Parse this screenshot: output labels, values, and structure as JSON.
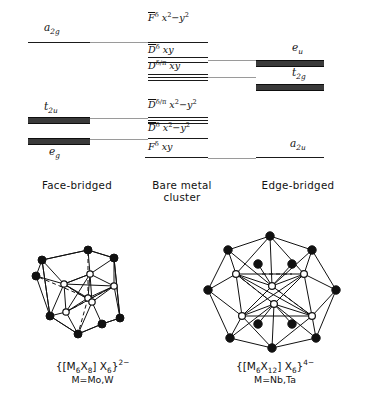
{
  "figure": {
    "type": "molecular-orbital-correlation-diagram",
    "columns": [
      {
        "key": "face_bridged",
        "caption": "Face-bridged",
        "caption_line2": ""
      },
      {
        "key": "bare_metal",
        "caption": "Bare metal",
        "caption_line2": "cluster"
      },
      {
        "key": "edge_bridged",
        "caption": "Edge-bridged",
        "caption_line2": ""
      }
    ]
  },
  "left_levels": [
    {
      "label_html": "a<sub>2g</sub>",
      "label_text": "a2g",
      "style": "thin",
      "y": 42,
      "label_y": 22
    },
    {
      "label_html": "t<sub>2u</sub>",
      "label_text": "t2u",
      "style": "thick",
      "y": 117,
      "label_y": 103
    },
    {
      "label_html": "e<sub>g</sub>",
      "label_text": "eg",
      "style": "thick",
      "y": 138,
      "label_y": 146
    }
  ],
  "center_levels": [
    {
      "label_html": "<span class='ovl'>F</span><sup>&#948;</sup> x<sup>2</sup>&#8722;y<sup>2</sup>",
      "label_text": "F-bar delta x2-y2",
      "style": "thin",
      "y": 42,
      "label_y": 14
    },
    {
      "label_html": "<span class='ovl'>D</span><sup>&#948;</sup> xy",
      "label_text": "D-bar delta xy",
      "style": "double",
      "y": 56,
      "label_y": 44
    },
    {
      "label_html": "D<sup>&#948;/&#960;</sup> xy",
      "label_text": "D delta/pi xy",
      "style": "triple",
      "y": 72,
      "label_y": 58
    },
    {
      "label_html": "<span class='ovl'>D</span><sup>&#948;/&#960;</sup> x<sup>2</sup>&#8722;y<sup>2</sup>",
      "label_text": "D-bar delta/pi x2-y2",
      "style": "triple",
      "y": 117,
      "label_y": 101
    },
    {
      "label_html": "<span class='ovl'>D</span><sup>&#948;</sup> x<sup>2</sup>&#8722;y<sup>2</sup>",
      "label_text": "D-bar delta x2-y2",
      "style": "thin",
      "y": 138,
      "label_y": 123
    },
    {
      "label_html": "F<sup>&#948;</sup> xy",
      "label_text": "F delta xy",
      "style": "thin",
      "y": 157,
      "label_y": 141
    }
  ],
  "right_levels": [
    {
      "label_html": "e<sub>u</sub>",
      "label_text": "eu",
      "style": "thick",
      "y": 60,
      "label_y": 42
    },
    {
      "label_html": "t<sub>2g</sub>",
      "label_text": "t2g",
      "style": "thick",
      "y": 84,
      "label_y": 68
    },
    {
      "label_html": "a<sub>2u</sub>",
      "label_text": "a2u",
      "style": "thin",
      "y": 157,
      "label_y": 139
    }
  ],
  "clusters": [
    {
      "key": "face_bridged_cluster",
      "formula_html": "{[M<sub>6</sub>X<sub>8</sub>] X<sub>6</sub>}<sup>2&#8722;</sup>",
      "formula_text": "{[M6X8]X6}2-",
      "metal_note": "M=Mo,W"
    },
    {
      "key": "edge_bridged_cluster",
      "formula_html": "{[M<sub>6</sub>X<sub>12</sub>] X<sub>6</sub>}<sup>4&#8722;</sup>",
      "formula_text": "{[M6X12]X6}4-",
      "metal_note": "M=Nb,Ta"
    }
  ],
  "colors": {
    "line": "#1a1a1a",
    "connector": "#9a9a9a",
    "vertex_filled": "#111111",
    "vertex_open": "#ffffff",
    "background": "#ffffff"
  }
}
